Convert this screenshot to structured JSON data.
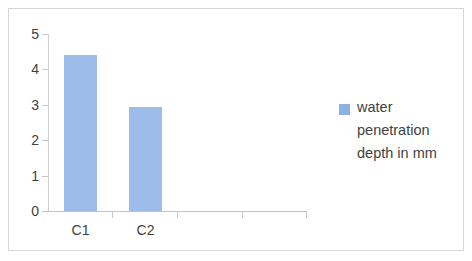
{
  "chart_data": {
    "type": "bar",
    "title": "",
    "xlabel": "",
    "ylabel": "",
    "categories": [
      "C1",
      "C2"
    ],
    "values": [
      4.4,
      2.95
    ],
    "series": [
      {
        "name": "water penetration depth in mm",
        "values": [
          4.4,
          2.95
        ]
      }
    ],
    "ylim": [
      0,
      5
    ],
    "ytick_labels": [
      "0",
      "1",
      "2",
      "3",
      "4",
      "5"
    ],
    "ytick_values": [
      0,
      1,
      2,
      3,
      4,
      5
    ],
    "grid": false,
    "legend_position": "right",
    "empty_category_slots": 2,
    "colors": {
      "bar_fill": "#9DBCE9",
      "legend_swatch": "#8CB0E4",
      "axis_line": "#C8C8C8",
      "tick_label": "#3F3F3F",
      "border": "#D6D6D6",
      "background": "#FFFFFF"
    }
  },
  "legend": {
    "series_label_lines": [
      "water",
      "penetration",
      "depth in mm"
    ],
    "series_label_full": "water penetration depth in mm"
  },
  "axes": {
    "x_categories": [
      "C1",
      "C2"
    ],
    "y_ticks": [
      "5",
      "4",
      "3",
      "2",
      "1",
      "0"
    ]
  }
}
